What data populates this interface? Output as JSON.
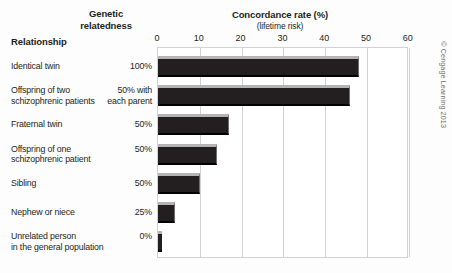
{
  "header": {
    "relationship_label": "Relationship",
    "genetic_line1": "Genetic",
    "genetic_line2": "relatedness",
    "concordance_title": "Concordance rate (%)",
    "concordance_subtitle": "(lifetime risk)"
  },
  "credit": "© Cengage Learning 2013",
  "chart_data": {
    "type": "bar",
    "orientation": "horizontal",
    "title": "Concordance rate (%)",
    "subtitle": "(lifetime risk)",
    "xlabel": "Concordance rate (%)",
    "ylabel": "Relationship",
    "xlim": [
      0,
      60
    ],
    "xticks": [
      0,
      10,
      20,
      30,
      40,
      50,
      60
    ],
    "grid": true,
    "legend": "none",
    "categories": [
      "Identical twin",
      "Offspring of two schizophrenic patients",
      "Fraternal twin",
      "Offspring of one schizophrenic patient",
      "Sibling",
      "Nephew or niece",
      "Unrelated person in the general population"
    ],
    "values": [
      48,
      46,
      17,
      14,
      10,
      4,
      1
    ],
    "genetic_relatedness": [
      "100%",
      "50% with each parent",
      "50%",
      "50%",
      "50%",
      "25%",
      "0%"
    ]
  },
  "rows": [
    {
      "label_line1": "Identical twin",
      "label_line2": "",
      "pct_line1": "100%",
      "pct_line2": "",
      "value": 48
    },
    {
      "label_line1": "Offspring of two",
      "label_line2": "schizophrenic patients",
      "pct_line1": "50% with",
      "pct_line2": "each parent",
      "value": 46
    },
    {
      "label_line1": "Fraternal twin",
      "label_line2": "",
      "pct_line1": "50%",
      "pct_line2": "",
      "value": 17
    },
    {
      "label_line1": "Offspring of one",
      "label_line2": "schizophrenic patient",
      "pct_line1": "50%",
      "pct_line2": "",
      "value": 14
    },
    {
      "label_line1": "Sibling",
      "label_line2": "",
      "pct_line1": "50%",
      "pct_line2": "",
      "value": 10
    },
    {
      "label_line1": "Nephew or niece",
      "label_line2": "",
      "pct_line1": "25%",
      "pct_line2": "",
      "value": 4
    },
    {
      "label_line1": "Unrelated person",
      "label_line2": "in the general population",
      "pct_line1": "0%",
      "pct_line2": "",
      "value": 1
    }
  ],
  "ticks": [
    "0",
    "10",
    "20",
    "30",
    "40",
    "50",
    "60"
  ]
}
